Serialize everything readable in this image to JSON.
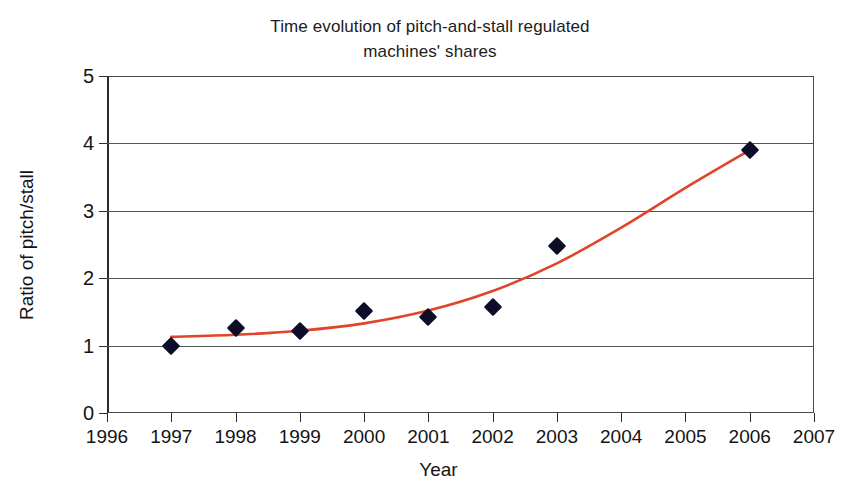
{
  "chart_data": {
    "type": "scatter",
    "title": "Time evolution of pitch-and-stall regulated machines' shares",
    "title_lines": [
      "Time evolution of pitch-and-stall regulated",
      "machines' shares"
    ],
    "xlabel": "Year",
    "ylabel": "Ratio of pitch/stall",
    "xlim": [
      1996,
      2007
    ],
    "ylim": [
      0,
      5
    ],
    "xticks": [
      1996,
      1997,
      1998,
      1999,
      2000,
      2001,
      2002,
      2003,
      2004,
      2005,
      2006,
      2007
    ],
    "yticks": [
      0,
      1,
      2,
      3,
      4,
      5
    ],
    "xtick_labels": [
      "1996",
      "1997",
      "1998",
      "1999",
      "2000",
      "2001",
      "2002",
      "2003",
      "2004",
      "2005",
      "2006",
      "2007"
    ],
    "ytick_labels": [
      "0",
      "1",
      "2",
      "3",
      "4",
      "5"
    ],
    "grid": "horizontal",
    "legend": null,
    "series": [
      {
        "name": "Ratio of pitch/stall",
        "type": "scatter",
        "marker": "diamond",
        "color": "#0d0d28",
        "x": [
          1997,
          1998,
          1999,
          2000,
          2001,
          2002,
          2003,
          2006
        ],
        "values": [
          1.0,
          1.26,
          1.22,
          1.52,
          1.43,
          1.58,
          2.48,
          3.9
        ]
      },
      {
        "name": "Exponential trend",
        "type": "line",
        "color": "#e0442b",
        "x": [
          1997,
          1998,
          1999,
          2000,
          2001,
          2002,
          2003,
          2004,
          2005,
          2006
        ],
        "values": [
          1.13,
          1.16,
          1.22,
          1.33,
          1.52,
          1.81,
          2.22,
          2.75,
          3.34,
          3.9
        ]
      }
    ]
  },
  "colors": {
    "marker": "#0d0d28",
    "trend_line": "#e0442b",
    "axis": "#2b2b2b",
    "grid": "#555555",
    "background": "#ffffff",
    "text": "#141414"
  }
}
